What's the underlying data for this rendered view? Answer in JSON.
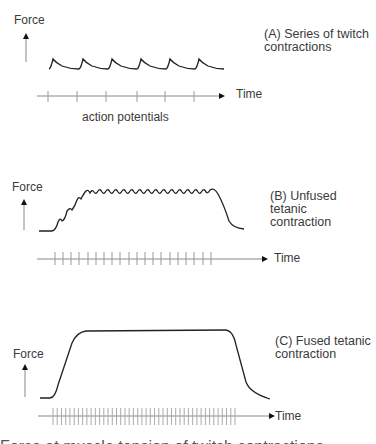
{
  "panels": [
    {
      "id": "A",
      "y_label": "Force",
      "x_label": "Time",
      "caption_line1": "(A) Series of twitch",
      "caption_line2": "contractions",
      "axis_caption": "action potentials",
      "twitch_count": 6,
      "action_potential_count": 6
    },
    {
      "id": "B",
      "y_label": "Force",
      "x_label": "Time",
      "caption_line1": "(B) Unfused tetanic",
      "caption_line2": "contraction",
      "action_potential_count": 20
    },
    {
      "id": "C",
      "y_label": "Force",
      "x_label": "Time",
      "caption_line1": "(C) Fused tetanic",
      "caption_line2": "contraction",
      "action_potential_count": 44
    }
  ],
  "footer_truncated_text": "Force at muscle tension of twitch contractions"
}
